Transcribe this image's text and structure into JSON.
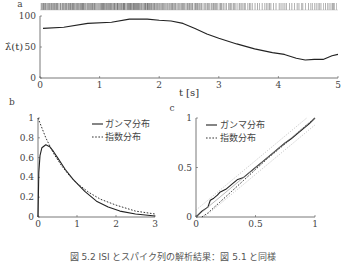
{
  "figure": {
    "caption": "図 5.2 ISI とスパイク列の解析結果：図 5.1 と同様"
  },
  "chart_data": [
    {
      "panel": "a",
      "type": "line",
      "title": "",
      "xlabel": "t [s]",
      "ylabel": "λ̂(t)",
      "xlim": [
        0,
        5
      ],
      "ylim": [
        0,
        100
      ],
      "xticks": [
        "0",
        "1",
        "2",
        "3",
        "4",
        "5"
      ],
      "yticks": [
        "0",
        "50",
        "100"
      ],
      "grid": false,
      "raster": "spike train shown above the plot (dense ticks, sparser toward t=5)",
      "series": [
        {
          "name": "estimated rate",
          "x": [
            0.05,
            0.4,
            0.8,
            1.2,
            1.5,
            1.8,
            2.0,
            2.2,
            2.4,
            2.6,
            2.8,
            3.0,
            3.3,
            3.6,
            3.9,
            4.1,
            4.3,
            4.45,
            4.6,
            4.75,
            4.9,
            5.0
          ],
          "values": [
            80,
            82,
            88,
            90,
            95,
            95,
            93,
            92,
            88,
            80,
            71,
            64,
            55,
            47,
            41,
            38,
            32,
            29,
            30,
            30,
            36,
            38
          ]
        }
      ]
    },
    {
      "panel": "b",
      "type": "line",
      "xlim": [
        0,
        3
      ],
      "ylim": [
        0,
        1
      ],
      "xticks": [
        "0",
        "1",
        "2",
        "3"
      ],
      "yticks": [
        "0",
        "0.2",
        "0.4",
        "0.6",
        "0.8",
        "1"
      ],
      "legend": [
        "ガンマ分布",
        "指数分布"
      ],
      "legend_position": "upper right",
      "series": [
        {
          "name": "ガンマ分布",
          "style": "solid",
          "x": [
            0,
            0.02,
            0.05,
            0.1,
            0.2,
            0.3,
            0.4,
            0.5,
            0.7,
            0.9,
            1.2,
            1.5,
            1.8,
            2.1,
            2.5,
            3.0
          ],
          "values": [
            0,
            0.45,
            0.62,
            0.7,
            0.73,
            0.71,
            0.66,
            0.6,
            0.48,
            0.38,
            0.26,
            0.16,
            0.1,
            0.06,
            0.03,
            0.01
          ]
        },
        {
          "name": "指数分布",
          "style": "dotted",
          "x": [
            0,
            0.2,
            0.4,
            0.6,
            0.8,
            1.0,
            1.3,
            1.6,
            2.0,
            2.5,
            3.0
          ],
          "values": [
            1.0,
            0.8,
            0.64,
            0.52,
            0.42,
            0.34,
            0.25,
            0.18,
            0.12,
            0.06,
            0.03
          ]
        }
      ]
    },
    {
      "panel": "c",
      "type": "line",
      "xlim": [
        0,
        1
      ],
      "ylim": [
        0,
        1
      ],
      "xticks": [
        "0",
        "0.5",
        "1"
      ],
      "yticks": [
        "0",
        "0.5",
        "1"
      ],
      "legend": [
        "ガンマ分布",
        "指数分布"
      ],
      "legend_position": "upper left",
      "series": [
        {
          "name": "ガンマ分布",
          "style": "solid",
          "x": [
            0,
            0.05,
            0.1,
            0.12,
            0.15,
            0.18,
            0.2,
            0.25,
            0.3,
            0.35,
            0.4,
            0.45,
            0.5,
            0.55,
            0.6,
            0.65,
            0.7,
            0.75,
            0.8,
            0.85,
            0.9,
            0.95,
            1.0
          ],
          "values": [
            0,
            0.06,
            0.1,
            0.17,
            0.19,
            0.22,
            0.25,
            0.28,
            0.33,
            0.38,
            0.4,
            0.45,
            0.5,
            0.55,
            0.6,
            0.65,
            0.7,
            0.75,
            0.79,
            0.84,
            0.89,
            0.94,
            1.0
          ]
        },
        {
          "name": "指数分布",
          "style": "dotted",
          "x": [
            0.05,
            0.1,
            0.2,
            0.3,
            0.4,
            0.5,
            0.6,
            0.7,
            0.8,
            0.9,
            1.0
          ],
          "values": [
            0.0,
            0.04,
            0.15,
            0.26,
            0.37,
            0.48,
            0.59,
            0.69,
            0.79,
            0.9,
            1.0
          ]
        },
        {
          "name": "diagonal",
          "style": "thin-gray",
          "x": [
            0,
            1
          ],
          "values": [
            0,
            1
          ]
        }
      ]
    }
  ],
  "panels": {
    "a": {
      "label": "a",
      "ylabel": "λ̂(t)",
      "xlabel": "t [s]"
    },
    "b": {
      "label": "b",
      "legend_gamma": "ガンマ分布",
      "legend_exp": "指数分布"
    },
    "c": {
      "label": "c",
      "legend_gamma": "ガンマ分布",
      "legend_exp": "指数分布"
    }
  }
}
